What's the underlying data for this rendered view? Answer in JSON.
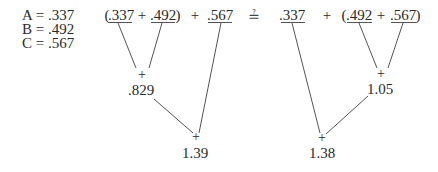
{
  "definitions": [
    {
      "name": "A",
      "value": ".337",
      "text": "A = .337"
    },
    {
      "name": "B",
      "value": ".492",
      "text": "B = .492"
    },
    {
      "name": "C",
      "value": ".567",
      "text": "C = .567"
    }
  ],
  "left_expression": {
    "open_paren": "(",
    "term1": ".337",
    "inner_op": "+",
    "term2": ".492",
    "close_paren": ")",
    "outer_op": "+",
    "term3": ".567",
    "partial_sum": ".829",
    "total": "1.39",
    "node_op": "+"
  },
  "comparison_symbol": "≟",
  "right_expression": {
    "term1": ".337",
    "outer_op": "+",
    "open_paren": "(",
    "term2": ".492",
    "inner_op": "+",
    "term3": ".567",
    "close_paren": ")",
    "partial_sum": "1.05",
    "total": "1.38",
    "node_op": "+"
  },
  "colors": {
    "ink": "#2a2a2a",
    "line": "#555555",
    "background": "#ffffff"
  }
}
